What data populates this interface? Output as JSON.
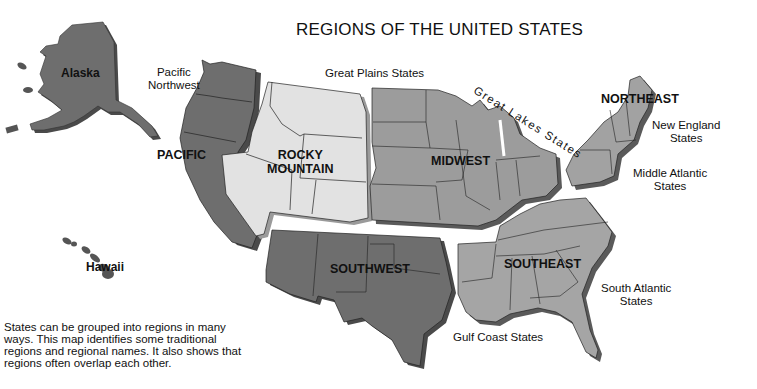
{
  "title": "REGIONS OF THE UNITED STATES",
  "colors": {
    "dark_region": "#6e6e6e",
    "medium_region": "#9a9a9a",
    "light_region": "#e0e0e0",
    "shadow": "#4a4a4a",
    "border": "#222222",
    "background": "#ffffff"
  },
  "regions": {
    "pacific": "PACIFIC",
    "rocky_mountain_line1": "ROCKY",
    "rocky_mountain_line2": "MOUNTAIN",
    "midwest": "MIDWEST",
    "northeast": "NORTHEAST",
    "southwest": "SOUTHWEST",
    "southeast": "SOUTHEAST"
  },
  "states": {
    "alaska": "Alaska",
    "hawaii": "Hawaii"
  },
  "subregions": {
    "pacific_northwest_line1": "Pacific",
    "pacific_northwest_line2": "Northwest",
    "great_plains": "Great Plains States",
    "great_lakes": "Great Lakes States",
    "new_england_line1": "New England",
    "new_england_line2": "States",
    "middle_atlantic_line1": "Middle Atlantic",
    "middle_atlantic_line2": "States",
    "south_atlantic_line1": "South Atlantic",
    "south_atlantic_line2": "States",
    "gulf_coast": "Gulf Coast States"
  },
  "note": "States can be grouped into regions in many ways. This map identifies some traditional regions and regional names.  It also shows that regions often overlap each other."
}
